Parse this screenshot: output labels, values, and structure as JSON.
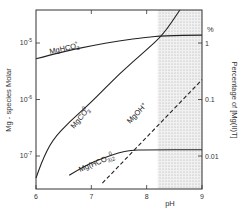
{
  "chart_data": {
    "type": "line",
    "title": "",
    "xlabel": "pH",
    "ylabel": "Mg - species  Molar",
    "ylabel_right": "Percentage  of  [Mg(II)T]",
    "right_axis_unit": "%",
    "xlim": [
      6,
      9
    ],
    "ylim_log10": [
      -7.6,
      -4.4
    ],
    "yscale": "log",
    "x_ticks": [
      "6",
      "7",
      "8",
      "9"
    ],
    "y_ticks": [
      {
        "label": "10^-5",
        "value": -5
      },
      {
        "label": "10^-6",
        "value": -6
      },
      {
        "label": "10^-7",
        "value": -7
      }
    ],
    "y_ticks_right": [
      {
        "label": "1",
        "value": -5
      },
      {
        "label": "0.1",
        "value": -6
      },
      {
        "label": "0.01",
        "value": -7
      }
    ],
    "shaded_region": {
      "x_from": 8.2,
      "x_to": 9,
      "note": "stippled region"
    },
    "grid": false,
    "series": [
      {
        "name": "MgHCO3+",
        "label_main": "MgHCO",
        "label_sub": "3",
        "label_sup": "+",
        "style": "solid",
        "points": [
          [
            6.0,
            -5.28
          ],
          [
            6.5,
            -5.15
          ],
          [
            7.0,
            -5.05
          ],
          [
            7.5,
            -4.96
          ],
          [
            8.0,
            -4.9
          ],
          [
            8.3,
            -4.87
          ],
          [
            9.0,
            -4.86
          ]
        ]
      },
      {
        "name": "MgCO3 0",
        "label_main": "MgCO",
        "label_sub": "3",
        "label_sup": "0",
        "style": "solid",
        "points": [
          [
            6.0,
            -7.39
          ],
          [
            6.1,
            -7.1
          ],
          [
            6.3,
            -6.71
          ],
          [
            6.6,
            -6.4
          ],
          [
            7.0,
            -6.05
          ],
          [
            7.5,
            -5.55
          ],
          [
            8.0,
            -5.12
          ],
          [
            8.3,
            -4.85
          ],
          [
            8.6,
            -4.41
          ]
        ]
      },
      {
        "name": "Mg(HCO3)2 0",
        "label_main": "Mg(HCO",
        "label_sub": "3)2",
        "label_sup": "0",
        "style": "solid",
        "points": [
          [
            6.6,
            -7.34
          ],
          [
            6.9,
            -7.16
          ],
          [
            7.2,
            -7.04
          ],
          [
            7.5,
            -6.94
          ],
          [
            7.7,
            -6.9
          ],
          [
            8.0,
            -6.89
          ],
          [
            9.0,
            -6.89
          ]
        ]
      },
      {
        "name": "MgOH+",
        "label_main": "MgOH",
        "label_sub": "",
        "label_sup": "+",
        "style": "dashed",
        "points": [
          [
            7.2,
            -7.48
          ],
          [
            9.0,
            -5.65
          ]
        ]
      }
    ]
  }
}
